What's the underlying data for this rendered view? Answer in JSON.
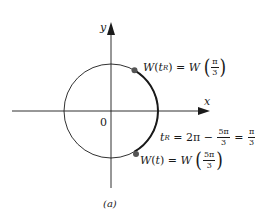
{
  "figure": {
    "caption": "(a)",
    "axes": {
      "x_label": "x",
      "y_label": "y",
      "origin_label": "0"
    },
    "colors": {
      "ink": "#1a1a1a",
      "point": "#555555"
    },
    "points": [
      {
        "name": "W(tR)",
        "lhs_func": "W",
        "lhs_arg": "t",
        "lhs_sub": "R",
        "rhs_func": "W",
        "frac_num": "π",
        "frac_den": "3"
      },
      {
        "name": "W(t)",
        "lhs_func": "W",
        "lhs_arg": "t",
        "rhs_func": "W",
        "frac_num": "5π",
        "frac_den": "3"
      }
    ],
    "reference_eq": {
      "lhs": "t",
      "lhs_sub": "R",
      "term1": "2π",
      "minus": "−",
      "frac1_num": "5π",
      "frac1_den": "3",
      "equals": "=",
      "frac2_num": "π",
      "frac2_den": "3"
    }
  }
}
